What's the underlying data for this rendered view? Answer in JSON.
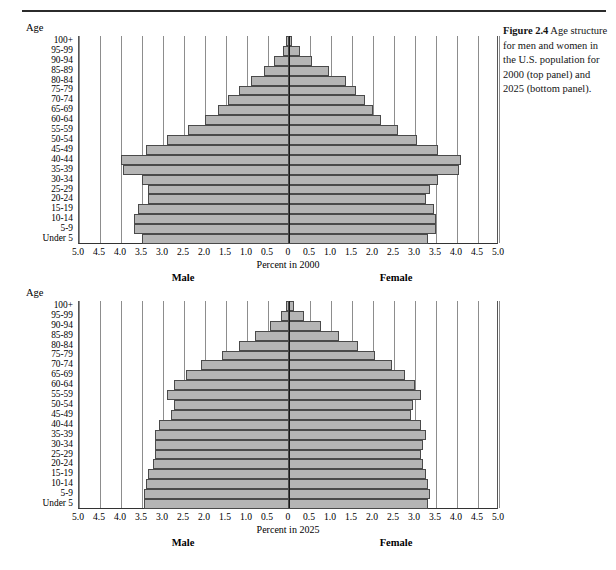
{
  "caption": {
    "figure_number": "Figure 2.4",
    "text": "Age structure for men and women in the U.S. population for 2000 (top panel) and 2025 (bottom panel)."
  },
  "axis_title_label": "Age",
  "colors": {
    "bar_fill": "#b5b5b5",
    "bar_stroke": "#4a4a4a",
    "gridline": "#8d8d8d",
    "zero_axis": "#1a1a1a",
    "text": "#000000"
  },
  "chart_data": [
    {
      "type": "bar",
      "title": "Percent in 2000",
      "subtitle": "Age structure for men and women in the U.S. population for 2000",
      "orientation": "horizontal-diverging",
      "panel": "top",
      "xlabel": "Percent in 2000",
      "ylabel": "Age",
      "left_series_label": "Male",
      "right_series_label": "Female",
      "xlim": [
        -5.0,
        5.0
      ],
      "xticks": [
        5.0,
        4.5,
        4.0,
        3.5,
        3.0,
        2.5,
        2.0,
        1.5,
        1.0,
        0.5,
        0,
        0.5,
        1.0,
        1.5,
        2.0,
        2.5,
        3.0,
        3.5,
        4.0,
        4.5,
        5.0
      ],
      "xticklabels": [
        "5.0",
        "4.5",
        "4.0",
        "3.5",
        "3.0",
        "2.5",
        "2.0",
        "1.5",
        "1.0",
        "0.5",
        "0",
        "0.5",
        "1.0",
        "1.5",
        "2.0",
        "2.5",
        "3.0",
        "3.5",
        "4.0",
        "4.5",
        "5.0"
      ],
      "grid": true,
      "legend": "none",
      "categories": [
        "100+",
        "95-99",
        "90-94",
        "85-89",
        "80-84",
        "75-79",
        "70-74",
        "65-69",
        "60-64",
        "55-59",
        "50-54",
        "45-49",
        "40-44",
        "35-39",
        "30-34",
        "25-29",
        "20-24",
        "15-19",
        "10-14",
        "5-9",
        "Under 5"
      ],
      "series": [
        {
          "name": "Male",
          "side": "left",
          "values": [
            0.05,
            0.15,
            0.35,
            0.6,
            0.9,
            1.2,
            1.45,
            1.7,
            2.0,
            2.4,
            2.9,
            3.4,
            4.0,
            3.95,
            3.5,
            3.35,
            3.35,
            3.6,
            3.7,
            3.7,
            3.5
          ]
        },
        {
          "name": "Female",
          "side": "right",
          "values": [
            0.08,
            0.25,
            0.55,
            0.95,
            1.35,
            1.6,
            1.8,
            2.0,
            2.2,
            2.6,
            3.05,
            3.55,
            4.1,
            4.05,
            3.55,
            3.35,
            3.25,
            3.45,
            3.5,
            3.5,
            3.3
          ]
        }
      ]
    },
    {
      "type": "bar",
      "title": "Percent in 2025",
      "subtitle": "Age structure for men and women in the U.S. population for 2025",
      "orientation": "horizontal-diverging",
      "panel": "bottom",
      "xlabel": "Percent in 2025",
      "ylabel": "Age",
      "left_series_label": "Male",
      "right_series_label": "Female",
      "xlim": [
        -5.0,
        5.0
      ],
      "xticks": [
        5.0,
        4.5,
        4.0,
        3.5,
        3.0,
        2.5,
        2.0,
        1.5,
        1.0,
        0.5,
        0,
        0.5,
        1.0,
        1.5,
        2.0,
        2.5,
        3.0,
        3.5,
        4.0,
        4.5,
        5.0
      ],
      "xticklabels": [
        "5.0",
        "4.5",
        "4.0",
        "3.5",
        "3.0",
        "2.5",
        "2.0",
        "1.5",
        "1.0",
        "0.5",
        "0",
        "0.5",
        "1.0",
        "1.5",
        "2.0",
        "2.5",
        "3.0",
        "3.5",
        "4.0",
        "4.5",
        "5.0"
      ],
      "grid": true,
      "legend": "none",
      "categories": [
        "100+",
        "95-99",
        "90-94",
        "85-89",
        "80-84",
        "75-79",
        "70-74",
        "65-69",
        "60-64",
        "55-59",
        "50-54",
        "45-49",
        "40-44",
        "35-39",
        "30-34",
        "25-29",
        "20-24",
        "15-19",
        "10-14",
        "5-9",
        "Under 5"
      ],
      "series": [
        {
          "name": "Male",
          "side": "left",
          "values": [
            0.07,
            0.2,
            0.45,
            0.8,
            1.2,
            1.6,
            2.1,
            2.45,
            2.75,
            2.9,
            2.75,
            2.8,
            3.1,
            3.2,
            3.2,
            3.2,
            3.25,
            3.35,
            3.4,
            3.45,
            3.45
          ]
        },
        {
          "name": "Female",
          "side": "right",
          "values": [
            0.12,
            0.35,
            0.75,
            1.2,
            1.65,
            2.05,
            2.45,
            2.75,
            3.0,
            3.15,
            2.95,
            2.9,
            3.15,
            3.25,
            3.2,
            3.15,
            3.2,
            3.25,
            3.3,
            3.35,
            3.3
          ]
        }
      ]
    }
  ]
}
